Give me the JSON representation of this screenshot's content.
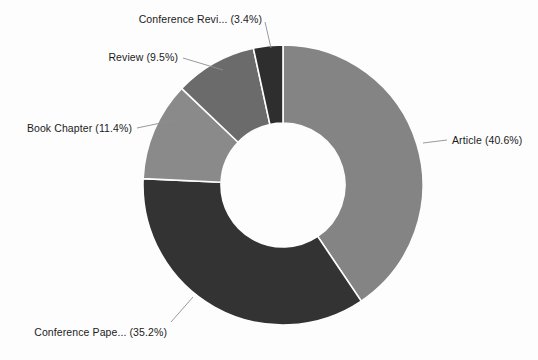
{
  "background_color": "#fdfdfd",
  "chart_data": {
    "type": "pie",
    "variant": "donut",
    "title": "",
    "subtitle": "",
    "xlabel": "",
    "ylabel": "",
    "legend_position": "none",
    "labels_position": "outside-with-leader-lines",
    "grid": false,
    "start_angle_deg": 0,
    "direction": "clockwise",
    "inner_radius_ratio": 0.44,
    "units": "percent",
    "total": 100.1,
    "categories": [
      "Article",
      "Conference Pape...",
      "Book Chapter",
      "Review",
      "Conference Revi..."
    ],
    "values": [
      40.6,
      35.2,
      11.4,
      9.5,
      3.4
    ],
    "colors": [
      "#848484",
      "#333333",
      "#8a8a8a",
      "#6b6b6b",
      "#2e2e2e"
    ],
    "slices": [
      {
        "name": "Article",
        "label": "Article (40.6%)",
        "value": 40.6,
        "value_text": "40.6%",
        "color": "#848484"
      },
      {
        "name": "Conference Pape...",
        "label": "Conference Pape... (35.2%)",
        "value": 35.2,
        "value_text": "35.2%",
        "color": "#333333"
      },
      {
        "name": "Book Chapter",
        "label": "Book Chapter (11.4%)",
        "value": 11.4,
        "value_text": "11.4%",
        "color": "#8a8a8a"
      },
      {
        "name": "Review",
        "label": "Review (9.5%)",
        "value": 9.5,
        "value_text": "9.5%",
        "color": "#6b6b6b"
      },
      {
        "name": "Conference Revi...",
        "label": "Conference Revi... (3.4%)",
        "value": 3.4,
        "value_text": "3.4%",
        "color": "#2e2e2e"
      }
    ]
  },
  "geometry": {
    "center_x": 283,
    "center_y": 185,
    "outer_radius": 140,
    "inner_radius": 62
  },
  "labels": {
    "article": "Article (40.6%)",
    "conference_paper": "Conference Pape... (35.2%)",
    "book_chapter": "Book Chapter (11.4%)",
    "review": "Review (9.5%)",
    "conference_review": "Conference Revi... (3.4%)"
  }
}
